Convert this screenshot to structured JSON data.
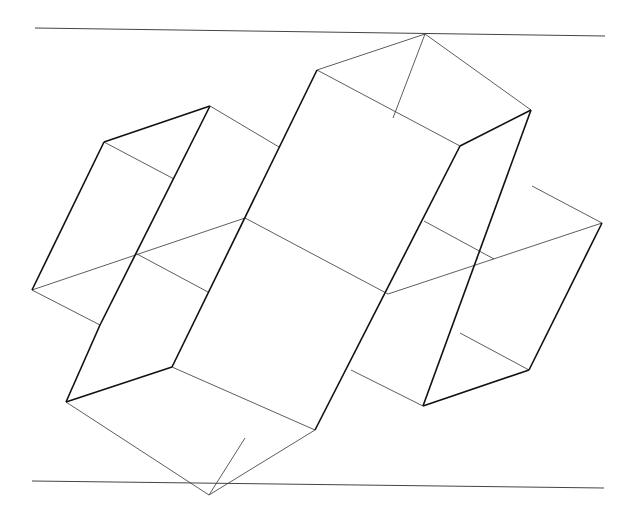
{
  "figure": {
    "background": "#ffffff",
    "stroke_color": "#111111",
    "rules": [
      {
        "name": "top-rule",
        "x1": 35,
        "y1": 28,
        "x2": 605,
        "y2": 36
      },
      {
        "name": "bottom-rule",
        "x1": 32,
        "y1": 481,
        "x2": 604,
        "y2": 488
      }
    ],
    "thick_lines": [
      [
        104,
        142,
        210,
        106
      ],
      [
        104,
        142,
        32,
        290
      ],
      [
        210,
        106,
        100,
        325
      ],
      [
        100,
        325,
        66,
        402
      ],
      [
        66,
        402,
        172,
        367
      ],
      [
        172,
        367,
        317,
        70
      ],
      [
        210,
        106,
        210,
        106
      ],
      [
        531,
        110,
        460,
        146
      ],
      [
        460,
        146,
        315,
        430
      ],
      [
        531,
        110,
        423,
        406
      ],
      [
        423,
        406,
        529,
        370
      ],
      [
        529,
        370,
        602,
        223
      ]
    ],
    "thin_lines": [
      [
        317,
        70,
        425,
        34
      ],
      [
        425,
        34,
        531,
        110
      ],
      [
        317,
        70,
        460,
        146
      ],
      [
        425,
        34,
        393,
        118
      ],
      [
        104,
        142,
        174,
        179
      ],
      [
        210,
        106,
        279,
        147
      ],
      [
        32,
        290,
        245,
        218
      ],
      [
        137,
        254,
        208,
        292
      ],
      [
        245,
        218,
        388,
        294
      ],
      [
        32,
        290,
        100,
        325
      ],
      [
        388,
        294,
        602,
        223
      ],
      [
        602,
        223,
        532,
        186
      ],
      [
        494,
        259,
        424,
        221
      ],
      [
        460,
        333,
        529,
        370
      ],
      [
        351,
        370,
        423,
        406
      ],
      [
        66,
        402,
        209,
        495
      ],
      [
        172,
        367,
        315,
        430
      ],
      [
        209,
        495,
        315,
        430
      ],
      [
        209,
        495,
        245,
        438
      ]
    ]
  }
}
